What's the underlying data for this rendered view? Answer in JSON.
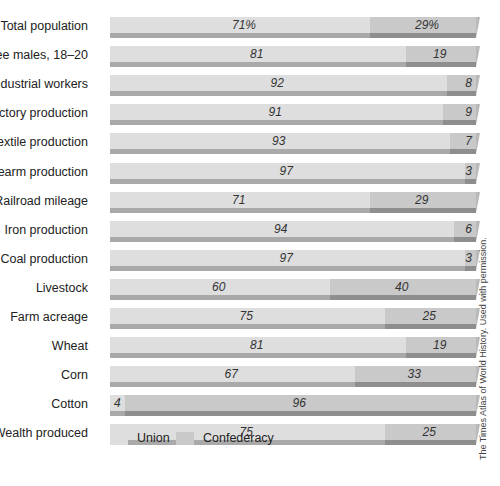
{
  "chart_data": {
    "type": "bar",
    "orientation": "horizontal",
    "stacked": true,
    "percent_stacked": true,
    "title": "",
    "xlabel": "",
    "ylabel": "",
    "categories": [
      "Total population",
      "Free males, 18–20",
      "Industrial workers",
      "Factory production",
      "Textile production",
      "Firearm production",
      "Railroad mileage",
      "Iron production",
      "Coal production",
      "Livestock",
      "Farm acreage",
      "Wheat",
      "Corn",
      "Cotton",
      "Wealth produced"
    ],
    "series": [
      {
        "name": "Union",
        "color": "#dedede",
        "values": [
          71,
          81,
          92,
          91,
          93,
          97,
          71,
          94,
          97,
          60,
          75,
          81,
          67,
          4,
          75
        ]
      },
      {
        "name": "Confederacy",
        "color": "#c9c9c9",
        "values": [
          29,
          19,
          8,
          9,
          7,
          3,
          29,
          6,
          3,
          40,
          25,
          19,
          33,
          96,
          25
        ]
      }
    ],
    "value_labels": {
      "union": [
        "71%",
        "81",
        "92",
        "91",
        "93",
        "97",
        "71",
        "94",
        "97",
        "60",
        "75",
        "81",
        "67",
        "4",
        "75"
      ],
      "confederacy": [
        "29%",
        "19",
        "8",
        "9",
        "7",
        "3",
        "29",
        "6",
        "3",
        "40",
        "25",
        "19",
        "33",
        "96",
        "25"
      ]
    },
    "xlim": [
      0,
      100
    ],
    "grid": false,
    "legend_position": "bottom"
  },
  "legend": {
    "union": "Union",
    "confederacy": "Confederacy"
  },
  "credit": "The Times Atlas of World History. Used with permission.",
  "colors": {
    "union_face": "#dedede",
    "union_bevel": "#a9a9a9",
    "confederacy_face": "#c9c9c9",
    "confederacy_bevel": "#8e8e8e"
  }
}
